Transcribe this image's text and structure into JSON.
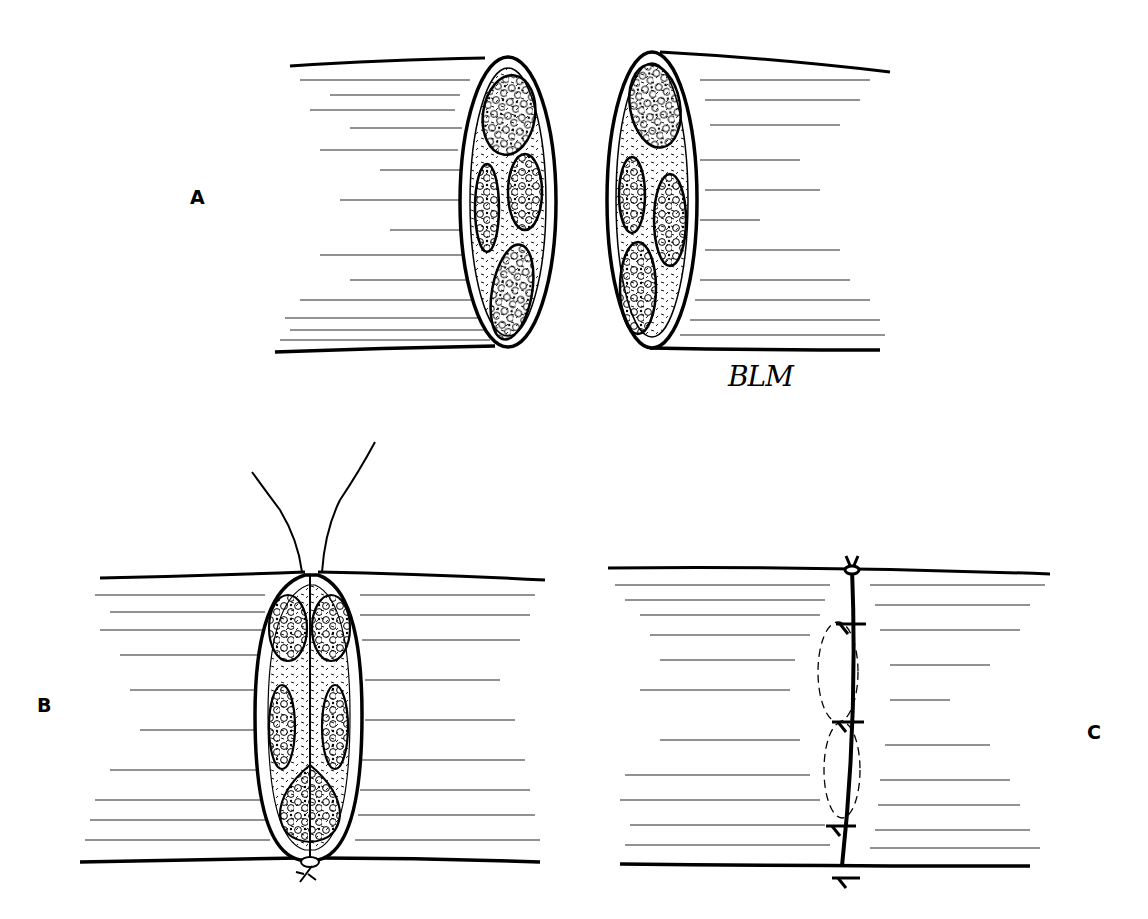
{
  "figure": {
    "colors": {
      "ink": "#000000",
      "background": "#ffffff"
    }
  },
  "panels": [
    {
      "id": "A",
      "label": "A",
      "content": "Two transected nerve stumps facing each other, cross-sections showing four fascicles each"
    },
    {
      "id": "B",
      "label": "B",
      "content": "Nerve ends approximated with fascicles aligned; a suture with two free strands at the top and a knot at the bottom"
    },
    {
      "id": "C",
      "label": "C",
      "content": "Completed epineurial repair with interrupted sutures along the coaptation line"
    }
  ],
  "signature": {
    "text": "BLM"
  }
}
